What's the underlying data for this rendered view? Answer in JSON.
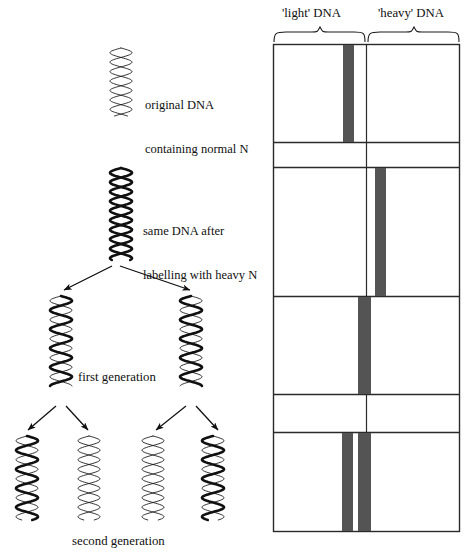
{
  "figure": {
    "title_present": false,
    "background_color": "#ffffff",
    "ink_color": "#101010",
    "band_color": "#545454",
    "band_color_light": "#6a6a6a"
  },
  "tube_panel": {
    "headers": [
      {
        "id": "light-dna",
        "label": "'light' DNA"
      },
      {
        "id": "heavy-dna",
        "label": "'heavy' DNA"
      }
    ],
    "geometry": {
      "left": 273,
      "right": 460,
      "top": 44,
      "bottom": 532,
      "divider_x": 366,
      "row_lines_y": [
        142,
        167,
        296,
        394,
        432
      ]
    },
    "tubes": [
      {
        "id": "tube-original",
        "row": 1,
        "top": 44,
        "bottom": 142,
        "bands": [
          {
            "id": "band-light",
            "x": 343,
            "width": 11,
            "shade": "#545454",
            "position_label": "light"
          }
        ]
      },
      {
        "id": "tube-heavy",
        "row": 2,
        "top": 167,
        "bottom": 296,
        "bands": [
          {
            "id": "band-heavy",
            "x": 375,
            "width": 11,
            "shade": "#545454",
            "position_label": "heavy"
          }
        ]
      },
      {
        "id": "tube-first-generation",
        "row": 3,
        "top": 296,
        "bottom": 394,
        "bands": [
          {
            "id": "band-hybrid",
            "x": 358,
            "width": 13,
            "shade": "#545454",
            "position_label": "hybrid"
          }
        ]
      },
      {
        "id": "tube-second-generation",
        "row": 4,
        "top": 432,
        "bottom": 532,
        "bands": [
          {
            "id": "band-light",
            "x": 342,
            "width": 11,
            "shade": "#545454",
            "position_label": "light"
          },
          {
            "id": "band-hybrid",
            "x": 358,
            "width": 13,
            "shade": "#545454",
            "position_label": "hybrid"
          }
        ]
      }
    ]
  },
  "annotations": {
    "original_dna": {
      "line1": "original DNA",
      "line2": "containing normal N"
    },
    "labelled_dna": {
      "line1": "same DNA after",
      "line2": "labelling with heavy N"
    },
    "first_generation": "first generation",
    "second_generation": "second generation"
  },
  "helices": [
    {
      "id": "helix-original",
      "generation": "parent",
      "strands": [
        "light",
        "light"
      ],
      "x": 108,
      "y": 48,
      "height": 68,
      "scale": 1.0
    },
    {
      "id": "helix-labelled",
      "generation": "labelled",
      "strands": [
        "heavy",
        "heavy"
      ],
      "x": 108,
      "y": 168,
      "height": 92,
      "scale": 1.0
    },
    {
      "id": "helix-gen1-left",
      "generation": "first",
      "strands": [
        "heavy",
        "light"
      ],
      "x": 48,
      "y": 296,
      "height": 90,
      "scale": 1.0
    },
    {
      "id": "helix-gen1-right",
      "generation": "first",
      "strands": [
        "light",
        "heavy"
      ],
      "x": 178,
      "y": 296,
      "height": 90,
      "scale": 1.0
    },
    {
      "id": "helix-gen2-1",
      "generation": "second",
      "strands": [
        "heavy",
        "light"
      ],
      "x": 14,
      "y": 436,
      "height": 84,
      "scale": 1.0
    },
    {
      "id": "helix-gen2-2",
      "generation": "second",
      "strands": [
        "light",
        "light"
      ],
      "x": 76,
      "y": 436,
      "height": 84,
      "scale": 1.0
    },
    {
      "id": "helix-gen2-3",
      "generation": "second",
      "strands": [
        "light",
        "light"
      ],
      "x": 140,
      "y": 436,
      "height": 84,
      "scale": 1.0
    },
    {
      "id": "helix-gen2-4",
      "generation": "second",
      "strands": [
        "light",
        "heavy"
      ],
      "x": 200,
      "y": 436,
      "height": 84,
      "scale": 1.0
    }
  ],
  "arrows": [
    {
      "id": "arrow-to-gen1-left",
      "from": [
        112,
        268
      ],
      "to": [
        62,
        292
      ]
    },
    {
      "id": "arrow-to-gen1-right",
      "from": [
        118,
        268
      ],
      "to": [
        192,
        292
      ]
    },
    {
      "id": "arrow-to-gen2-1",
      "from": [
        58,
        408
      ],
      "to": [
        26,
        432
      ]
    },
    {
      "id": "arrow-to-gen2-2",
      "from": [
        66,
        408
      ],
      "to": [
        88,
        432
      ]
    },
    {
      "id": "arrow-to-gen2-3",
      "from": [
        188,
        408
      ],
      "to": [
        154,
        432
      ]
    },
    {
      "id": "arrow-to-gen2-4",
      "from": [
        196,
        408
      ],
      "to": [
        218,
        432
      ]
    }
  ]
}
